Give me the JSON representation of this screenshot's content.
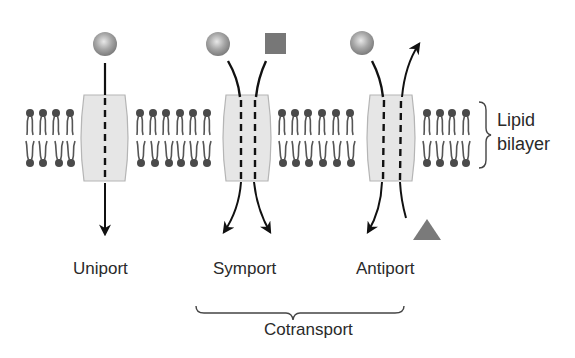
{
  "diagram": {
    "membrane_label": {
      "line1": "Lipid",
      "line2": "bilayer"
    },
    "transporters": [
      {
        "label": "Uniport",
        "solutes": [
          "sphere"
        ],
        "directions": [
          "in"
        ]
      },
      {
        "label": "Symport",
        "solutes": [
          "sphere",
          "square"
        ],
        "directions": [
          "in",
          "in"
        ]
      },
      {
        "label": "Antiport",
        "solutes": [
          "sphere",
          "triangle"
        ],
        "directions": [
          "in",
          "out"
        ]
      }
    ],
    "group_label": "Cotransport",
    "colors": {
      "channel_fill": "#e6e6e6",
      "channel_stroke": "#b5b5b5",
      "lipid": "#4a4a4a",
      "sphere": "#9a9a9a",
      "square": "#777777",
      "triangle": "#7a7a7a",
      "arrow": "#111111"
    }
  }
}
